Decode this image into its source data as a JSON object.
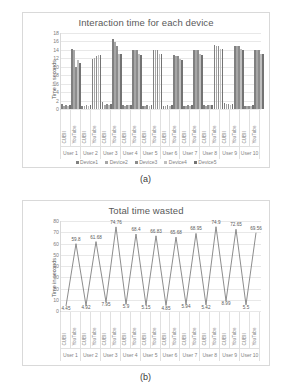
{
  "figures": [
    {
      "caption": "(a)",
      "chart_data": {
        "type": "bar",
        "title": "Interaction time for each device",
        "xlabel": "",
        "ylabel": "Time in seconds",
        "ylim": [
          0,
          18
        ],
        "yticks": [
          0,
          2,
          4,
          6,
          8,
          10,
          12,
          14,
          16,
          18
        ],
        "grid": true,
        "legend_position": "bottom",
        "groups": [
          "User 1",
          "User 2",
          "User 3",
          "User 4",
          "User 5",
          "User 6",
          "User 7",
          "User 8",
          "User 9",
          "User 10"
        ],
        "subcategories": [
          "CUBII",
          "YouTube"
        ],
        "categories": [
          "User 1 CUBII",
          "User 1 YouTube",
          "User 2 CUBII",
          "User 2 YouTube",
          "User 3 CUBII",
          "User 3 YouTube",
          "User 4 CUBII",
          "User 4 YouTube",
          "User 5 CUBII",
          "User 5 YouTube",
          "User 6 CUBII",
          "User 6 YouTube",
          "User 7 CUBII",
          "User 7 YouTube",
          "User 8 CUBII",
          "User 8 YouTube",
          "User 9 CUBII",
          "User 9 YouTube",
          "User 10 CUBII",
          "User 10 YouTube"
        ],
        "series": [
          {
            "name": "Device1",
            "color": "#808080",
            "values": [
              1.1,
              14.1,
              0.8,
              11.9,
              1.6,
              16.7,
              0.9,
              14.0,
              0.8,
              14.0,
              0.7,
              12.7,
              0.8,
              14.0,
              0.9,
              15.1,
              1.5,
              15.0,
              0.6,
              14.0
            ]
          },
          {
            "name": "Device2",
            "color": "#a6a6a6",
            "values": [
              0.6,
              13.9,
              0.7,
              12.0,
              0.9,
              15.9,
              0.8,
              13.9,
              0.7,
              13.9,
              0.8,
              12.6,
              0.7,
              13.9,
              0.8,
              15.0,
              1.3,
              14.9,
              0.7,
              13.9
            ]
          },
          {
            "name": "Device3",
            "color": "#8c8c8c",
            "values": [
              0.9,
              9.9,
              0.9,
              12.6,
              1.2,
              14.9,
              1.0,
              13.9,
              0.9,
              13.9,
              0.9,
              12.5,
              0.9,
              13.9,
              1.0,
              14.9,
              1.1,
              14.9,
              0.8,
              13.9
            ]
          },
          {
            "name": "Device4",
            "color": "#bfbfbf",
            "values": [
              0.8,
              11.5,
              0.8,
              12.8,
              1.0,
              13.1,
              0.9,
              13.0,
              0.8,
              13.1,
              0.8,
              11.8,
              0.8,
              13.0,
              0.9,
              14.2,
              1.0,
              14.1,
              0.7,
              13.0
            ]
          },
          {
            "name": "Device5",
            "color": "#737373",
            "values": [
              1.0,
              10.8,
              1.0,
              12.8,
              1.1,
              13.0,
              1.0,
              12.8,
              0.9,
              13.0,
              1.0,
              11.6,
              0.9,
              12.9,
              1.0,
              14.1,
              1.2,
              14.0,
              0.9,
              13.0
            ]
          }
        ]
      }
    },
    {
      "caption": "(b)",
      "chart_data": {
        "type": "line",
        "title": "Total time wasted",
        "xlabel": "",
        "ylabel": "Time in seconds",
        "ylim": [
          0,
          80
        ],
        "yticks": [
          0,
          10,
          20,
          30,
          40,
          50,
          60,
          70,
          80
        ],
        "grid": true,
        "legend_position": "none",
        "line_color": "#808080",
        "groups": [
          "User 1",
          "User 2",
          "User 3",
          "User 4",
          "User 5",
          "User 6",
          "User 7",
          "User 8",
          "User 9",
          "User 10"
        ],
        "subcategories": [
          "CUBII",
          "YouTube"
        ],
        "categories": [
          "User 1 CUBII",
          "User 1 YouTube",
          "User 2 CUBII",
          "User 2 YouTube",
          "User 3 CUBII",
          "User 3 YouTube",
          "User 4 CUBII",
          "User 4 YouTube",
          "User 5 CUBII",
          "User 5 YouTube",
          "User 6 CUBII",
          "User 6 YouTube",
          "User 7 CUBII",
          "User 7 YouTube",
          "User 8 CUBII",
          "User 8 YouTube",
          "User 9 CUBII",
          "User 9 YouTube",
          "User 10 CUBII",
          "User 10 YouTube"
        ],
        "values": [
          4.45,
          59.8,
          4.92,
          61.68,
          7.95,
          74.76,
          5.9,
          68.4,
          5.15,
          66.83,
          4.85,
          65.68,
          5.94,
          68.95,
          5.42,
          74.9,
          8.99,
          72.65,
          5.5,
          69.56
        ],
        "point_labels": [
          "4.45",
          "59.8",
          "4.92",
          "61.68",
          "7.95",
          "74.76",
          "5.9",
          "68.4",
          "5.15",
          "66.83",
          "4.85",
          "65.68",
          "5.94",
          "68.95",
          "5.42",
          "74.9",
          "8.99",
          "72.65",
          "5.5",
          "69.56"
        ]
      }
    }
  ]
}
